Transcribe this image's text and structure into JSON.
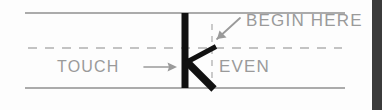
{
  "diagram": {
    "background_color": "#fdfdfd",
    "edge_strip_color": "#3b3b3b",
    "stroke_color": "#111111",
    "guide_color": "#8f8f8f",
    "label_color": "#9a9a9a",
    "labels": {
      "begin_here": "BEGIN HERE",
      "even": "EVEN",
      "touch": "TOUCH"
    },
    "icons": {
      "begin_here_arrow": "arrow-down-left-icon",
      "touch_arrow": "arrow-right-icon"
    },
    "guides": {
      "top_rule": {
        "x1": 25,
        "y1": 13,
        "x2": 345,
        "y2": 13
      },
      "bottom_rule": {
        "x1": 25,
        "y1": 88,
        "x2": 345,
        "y2": 88
      },
      "mid_dashed_rule": {
        "x1": 28,
        "y1": 48,
        "x2": 342,
        "y2": 48
      },
      "vertical_dashed_rule": {
        "x1": 212,
        "y1": 24,
        "x2": 212,
        "y2": 86
      }
    },
    "letter": {
      "glyph": "K",
      "stem": {
        "x1": 185,
        "y1": 13,
        "x2": 185,
        "y2": 88,
        "width": 7
      },
      "upper_arm": {
        "x1": 186,
        "y1": 62,
        "x2": 215,
        "y2": 47,
        "width": 5
      },
      "lower_arm": {
        "x1": 186,
        "y1": 62,
        "x2": 213,
        "y2": 88,
        "width": 7
      }
    }
  }
}
